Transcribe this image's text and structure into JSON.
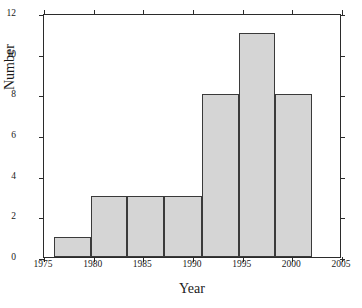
{
  "chart_data": {
    "type": "bar",
    "title": "",
    "xlabel": "Year",
    "ylabel": "Number",
    "xlim": [
      1975,
      2005
    ],
    "ylim": [
      0,
      12
    ],
    "xticks": [
      1975,
      1980,
      1985,
      1990,
      1995,
      2000,
      2005
    ],
    "yticks": [
      0,
      2,
      4,
      6,
      8,
      10,
      12
    ],
    "xtick_labels": [
      "1975",
      "1980",
      "1985",
      "1990",
      "1995",
      "2000",
      "2005"
    ],
    "ytick_labels": [
      "0",
      "2",
      "4",
      "6",
      "8",
      "10",
      "12"
    ],
    "grid": false,
    "legend": null,
    "bar_color": "#d5d5d5",
    "bar_edge_color": "#3a3a3a",
    "categories": [
      "1976.0-1979.7",
      "1979.7-1983.4",
      "1983.4-1987.1",
      "1987.1-1990.9",
      "1990.9-1994.6",
      "1994.6-1998.3",
      "1998.3-2002.0"
    ],
    "bin_edges": [
      1976.0,
      1979.7,
      1983.4,
      1987.1,
      1990.9,
      1994.6,
      1998.3,
      2002.0
    ],
    "values": [
      1,
      3,
      3,
      3,
      8,
      11,
      8
    ]
  }
}
